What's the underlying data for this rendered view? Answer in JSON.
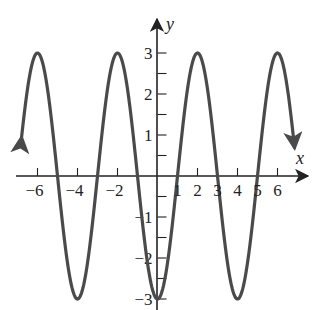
{
  "chart_data": {
    "type": "line",
    "title": "",
    "xlabel": "x",
    "ylabel": "y",
    "function": "y = -3 cos(pi x / 2)",
    "amplitude": 3,
    "period": 4,
    "xlim": [
      -7,
      7.5
    ],
    "ylim": [
      -3.3,
      3.8
    ],
    "grid": false,
    "legend": null,
    "x_tick_labels": [
      "-6",
      "-4",
      "-2",
      "2",
      "4",
      "6"
    ],
    "x_tick_values": [
      -6,
      -4,
      -2,
      2,
      4,
      6
    ],
    "x_minor_ticks": [
      -6,
      -4,
      -2,
      2,
      4,
      6
    ],
    "y_tick_labels": [
      "-3",
      "-2",
      "-1",
      "1",
      "2",
      "3"
    ],
    "y_tick_values": [
      -3,
      -2,
      -1,
      1,
      2,
      3
    ],
    "y_minor_ticks": [
      -3,
      -2.5,
      -2,
      -1.5,
      -1,
      -0.5,
      0.5,
      1,
      1.5,
      2,
      2.5,
      3
    ],
    "zero_crossing_labels": [
      "1",
      "3",
      "5"
    ],
    "series": [
      {
        "name": "curve",
        "color": "#4a4a4a",
        "x_range": [
          -6.8,
          6.85
        ],
        "arrows_at_ends": true,
        "key_points": [
          {
            "x": -6,
            "y": 3
          },
          {
            "x": -5,
            "y": 0
          },
          {
            "x": -4,
            "y": -3
          },
          {
            "x": -3,
            "y": 0
          },
          {
            "x": -2,
            "y": 3
          },
          {
            "x": -1,
            "y": 0
          },
          {
            "x": 0,
            "y": -3
          },
          {
            "x": 1,
            "y": 0
          },
          {
            "x": 2,
            "y": 3
          },
          {
            "x": 3,
            "y": 0
          },
          {
            "x": 4,
            "y": -3
          },
          {
            "x": 5,
            "y": 0
          },
          {
            "x": 6,
            "y": 3
          }
        ]
      }
    ]
  },
  "axes": {
    "x_label": "x",
    "y_label": "y",
    "color": "#222222"
  }
}
